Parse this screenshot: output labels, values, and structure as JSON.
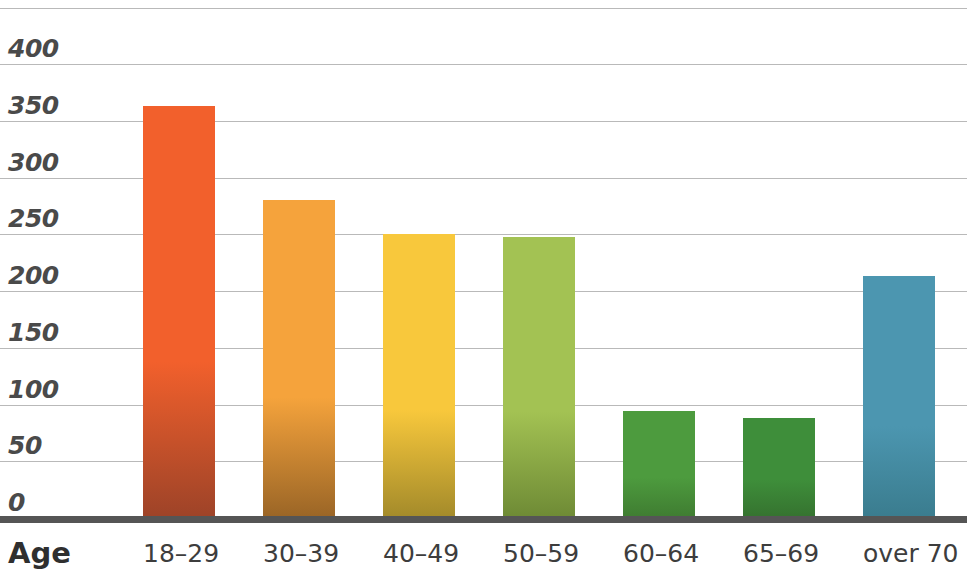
{
  "chart_data": {
    "type": "bar",
    "title": "",
    "subtitle": "",
    "xlabel": "Age",
    "ylabel": "",
    "categories": [
      "18–29",
      "30–39",
      "40–49",
      "50–59",
      "60–64",
      "65–69",
      "over 70"
    ],
    "values": [
      363,
      280,
      250,
      248,
      94,
      88,
      213
    ],
    "ylim": [
      0,
      425
    ],
    "ytick_labels": [
      "0",
      "50",
      "100",
      "150",
      "200",
      "250",
      "300",
      "350",
      "400"
    ],
    "ytick_values": [
      0,
      50,
      100,
      150,
      200,
      250,
      300,
      350,
      400
    ],
    "grid": true,
    "legend": "none",
    "bar_colors_top": [
      "#F2602C",
      "#F5A33C",
      "#F8C83C",
      "#A3C253",
      "#4D9B3E",
      "#3E8E3A",
      "#4C96B0"
    ],
    "bar_colors_bottom": [
      "#9D4328",
      "#9A6526",
      "#A38A2A",
      "#6E8A35",
      "#3F7C31",
      "#35722F",
      "#3A7C8E"
    ],
    "axis_line_color": "#555555",
    "gridline_color": "#b9b9b9",
    "tick_label_color": "#4a4a4a",
    "background_color": "#ffffff"
  }
}
